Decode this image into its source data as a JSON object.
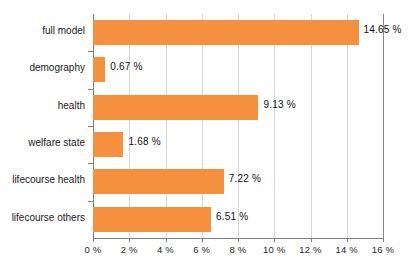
{
  "chart_data": {
    "type": "bar",
    "orientation": "horizontal",
    "title": "",
    "subtitle": "",
    "xlabel": "",
    "ylabel": "",
    "categories": [
      "full model",
      "demography",
      "health",
      "welfare state",
      "lifecourse health",
      "lifecourse others"
    ],
    "values": [
      14.65,
      0.67,
      9.13,
      1.68,
      7.22,
      6.51
    ],
    "value_labels": [
      "14.65 %",
      "0.67 %",
      "9.13 %",
      "1.68 %",
      "7.22 %",
      "6.51 %"
    ],
    "xlim": [
      0,
      16
    ],
    "xticks": [
      0,
      2,
      4,
      6,
      8,
      10,
      12,
      14,
      16
    ],
    "xtick_labels": [
      "0 %",
      "2 %",
      "4 %",
      "6 %",
      "8 %",
      "10 %",
      "12 %",
      "14 %",
      "16 %"
    ],
    "grid": true,
    "grid_axis": "x",
    "legend": null,
    "bar_color": "#f5903f",
    "grid_color": "#d6d6d6",
    "axis_color": "#7d7d7d",
    "background_color": "#ffffff",
    "unit": "%"
  }
}
